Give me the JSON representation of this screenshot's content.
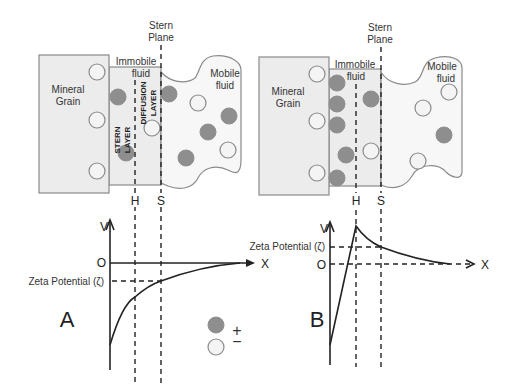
{
  "panel_a": {
    "letter": "A",
    "stern_plane_line1": "Stern",
    "stern_plane_line2": "Plane",
    "immobile_line1": "Immobile",
    "immobile_line2": "fluid",
    "mineral_line1": "Mineral",
    "mineral_line2": "Grain",
    "mobile_line1": "Mobile",
    "mobile_line2": "fluid",
    "stern_layer_1": "STERN",
    "stern_layer_2": "LAYER",
    "diffusion_layer_1": "DIFFUSION",
    "diffusion_layer_2": "LAYER",
    "h_label": "H",
    "s_label": "S",
    "v_label": "V",
    "o_label": "O",
    "x_label": "X",
    "zeta_label": "Zeta Potential (ζ)"
  },
  "panel_b": {
    "letter": "B",
    "stern_plane_line1": "Stern",
    "stern_plane_line2": "Plane",
    "immobile_line1": "Immobile",
    "immobile_line2": "fluid",
    "mineral_line1": "Mineral",
    "mineral_line2": "Grain",
    "mobile_line1": "Mobile",
    "mobile_line2": "fluid",
    "h_label": "H",
    "s_label": "S",
    "v_label": "V",
    "o_label": "O",
    "x_label": "X",
    "zeta_label": "Zeta  Potential (ζ)"
  },
  "legend": {
    "positive_symbol": "+",
    "negative_symbol": "−",
    "positive_meaning": "positive ion (filled circle)",
    "negative_meaning": "negative ion (open circle)"
  },
  "colors": {
    "positive_ion": "#8e8e8e",
    "negative_ion": "#f4f4f4",
    "grain_fill": "#ececec",
    "line": "#222222"
  }
}
